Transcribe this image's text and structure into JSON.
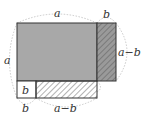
{
  "diagram": {
    "labels": {
      "top_a": "a",
      "top_b": "b",
      "right_a_minus_b": "a−b",
      "left_a": "a",
      "inner_b": "b",
      "bottom_b": "b",
      "bottom_a_minus_b": "a−b"
    },
    "colors": {
      "main_fill": "#a8a8a8",
      "strip_fill": "#9a9a9a",
      "hatch": "#555555",
      "outline": "#333333",
      "dotted": "#bbbbbb"
    }
  }
}
